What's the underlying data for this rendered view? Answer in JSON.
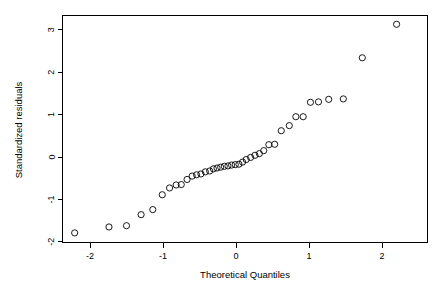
{
  "figure": {
    "name": "normal-qq-plot",
    "background_color": "#ffffff",
    "foreground_color": "#000000",
    "width": 442,
    "height": 287
  },
  "chart_data": {
    "type": "scatter",
    "title": "",
    "xlabel": "Theoretical Quantiles",
    "ylabel": "Standardized residuals",
    "xlim": [
      -2.42,
      2.58
    ],
    "ylim": [
      -2.0,
      3.35
    ],
    "xticks": [
      -2,
      -1,
      0,
      1,
      2
    ],
    "xticklabels": [
      "-2",
      "-1",
      "0",
      "1",
      "2"
    ],
    "yticks": [
      -2,
      -1,
      0,
      1,
      2,
      3
    ],
    "yticklabels": [
      "-2",
      "-1",
      "0",
      "1",
      "2",
      "3"
    ],
    "grid": false,
    "legend": null,
    "marker": "open-circle",
    "marker_size": 3.1,
    "series": [
      {
        "name": "standardized residuals",
        "x": [
          -2.21,
          -1.74,
          -1.5,
          -1.3,
          -1.14,
          -1.01,
          -0.91,
          -0.82,
          -0.75,
          -0.67,
          -0.6,
          -0.54,
          -0.48,
          -0.42,
          -0.36,
          -0.31,
          -0.26,
          -0.21,
          -0.16,
          -0.11,
          -0.06,
          -0.01,
          0.04,
          0.09,
          0.14,
          0.2,
          0.26,
          0.32,
          0.38,
          0.45,
          0.53,
          0.62,
          0.73,
          0.82,
          0.92,
          1.02,
          1.13,
          1.27,
          1.47,
          1.73,
          2.2
        ],
        "y": [
          -1.79,
          -1.65,
          -1.62,
          -1.36,
          -1.24,
          -0.89,
          -0.73,
          -0.66,
          -0.65,
          -0.53,
          -0.45,
          -0.42,
          -0.4,
          -0.35,
          -0.33,
          -0.28,
          -0.26,
          -0.24,
          -0.22,
          -0.21,
          -0.19,
          -0.18,
          -0.17,
          -0.12,
          -0.06,
          -0.01,
          0.04,
          0.08,
          0.15,
          0.29,
          0.3,
          0.62,
          0.74,
          0.95,
          0.95,
          1.29,
          1.3,
          1.36,
          1.37,
          2.34,
          3.13
        ]
      }
    ]
  }
}
